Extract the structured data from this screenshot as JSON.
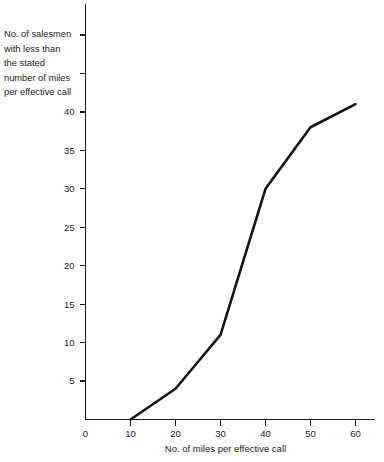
{
  "chart_data": {
    "type": "line",
    "title": "",
    "subtitle": "",
    "xlabel": "No. of miles per effective call",
    "ylabel": "No. of salesmen with less than the stated number of miles per effective call",
    "ylabel_lines": [
      "No. of salesmen",
      "with less than",
      "the stated",
      "number of miles",
      "per effective call"
    ],
    "x": [
      10,
      20,
      30,
      40,
      50,
      60
    ],
    "values": [
      0,
      4,
      11,
      30,
      38,
      41
    ],
    "series": [
      {
        "name": "Cumulative no. of salesmen",
        "values": [
          0,
          4,
          11,
          30,
          38,
          41
        ]
      }
    ],
    "xlim": [
      0,
      63
    ],
    "ylim": [
      0,
      45
    ],
    "xticks": [
      0,
      10,
      20,
      30,
      40,
      50,
      60
    ],
    "yticks": [
      5,
      10,
      15,
      20,
      25,
      30,
      35,
      40
    ],
    "xtick_labels": [
      "0",
      "10",
      "20",
      "30",
      "40",
      "50",
      "60"
    ],
    "ytick_labels": [
      "5",
      "10",
      "15",
      "20",
      "25",
      "30",
      "35",
      "40"
    ],
    "grid": false,
    "legend": "none",
    "line_color": "#141414",
    "axis_color": "#1a1a1a",
    "background_color": "#ffffff"
  },
  "axes": {
    "x_title": "No. of miles per effective call",
    "y_title_lines": [
      "No. of salesmen",
      "with less than",
      "the stated",
      "number of miles",
      "per effective call"
    ]
  }
}
